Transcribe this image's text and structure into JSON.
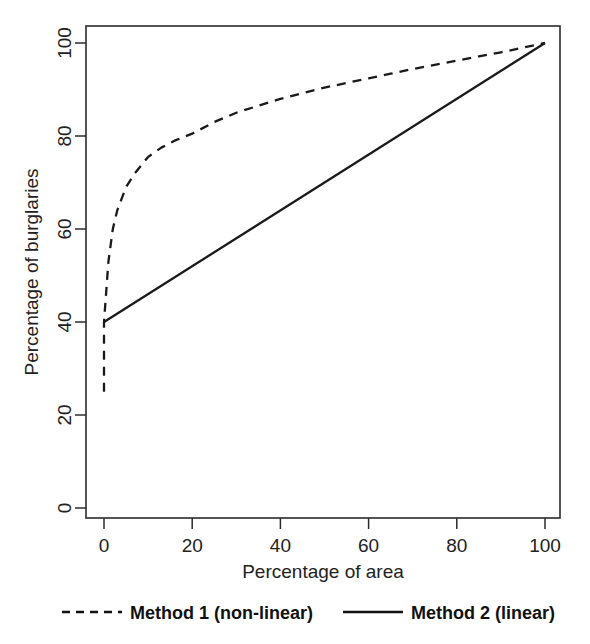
{
  "chart_data": {
    "type": "line",
    "title": "",
    "xlabel": "Percentage of area",
    "ylabel": "Percentage of burglaries",
    "xlim": [
      0,
      100
    ],
    "ylim": [
      0,
      100
    ],
    "xticks": [
      0,
      20,
      40,
      60,
      80,
      100
    ],
    "yticks": [
      0,
      20,
      40,
      60,
      80,
      100
    ],
    "xtick_labels": [
      "0",
      "20",
      "40",
      "60",
      "80",
      "100"
    ],
    "ytick_labels": [
      "0",
      "20",
      "40",
      "60",
      "80",
      "100"
    ],
    "grid": false,
    "legend_position": "below-plot",
    "series": [
      {
        "name": "Method 1 (non-linear)",
        "style": "dashed",
        "color": "#1a1a1a",
        "x": [
          0,
          0,
          1,
          2,
          3,
          5,
          7,
          10,
          13,
          16,
          20,
          25,
          30,
          35,
          40,
          45,
          50,
          55,
          60,
          65,
          70,
          75,
          80,
          85,
          90,
          95,
          100
        ],
        "y": [
          25,
          40,
          53,
          60,
          64,
          69,
          72,
          75.5,
          77.5,
          79,
          80.5,
          83,
          85,
          86.5,
          88,
          89.2,
          90.4,
          91.4,
          92.4,
          93.4,
          94.4,
          95.3,
          96.2,
          97.1,
          98,
          99,
          100
        ]
      },
      {
        "name": "Method 2 (linear)",
        "style": "solid",
        "color": "#1a1a1a",
        "x": [
          0,
          100
        ],
        "y": [
          40,
          100
        ]
      }
    ],
    "annotations": []
  },
  "legend": {
    "items": [
      {
        "label": "Method 1 (non-linear)",
        "style": "dashed"
      },
      {
        "label": "Method 2 (linear)",
        "style": "solid"
      }
    ]
  }
}
